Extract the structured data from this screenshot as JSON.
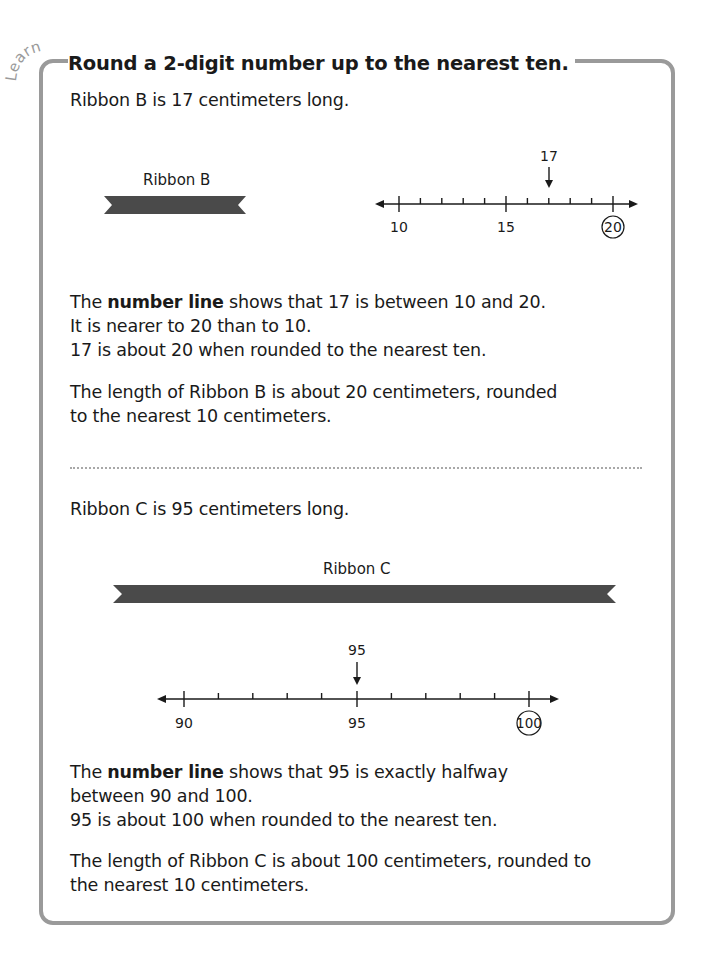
{
  "section_tag": "Learn",
  "title": "Round a 2-digit number up to the nearest ten.",
  "part_b": {
    "intro": "Ribbon B is 17 centimeters long.",
    "ribbon_label": "Ribbon B",
    "number_line": {
      "marked_value": "17",
      "labels": [
        "10",
        "15",
        "20"
      ],
      "circled_label": "20"
    },
    "explanation": {
      "line1_prefix": "The ",
      "line1_bold": "number line",
      "line1_suffix": " shows that 17 is between 10 and 20.",
      "line2": "It is nearer to 20 than to 10.",
      "line3": "17 is about 20 when rounded to the nearest ten."
    },
    "conclusion": {
      "line1": "The length of Ribbon B is about 20 centimeters, rounded",
      "line2": "to the nearest 10 centimeters."
    }
  },
  "part_c": {
    "intro": "Ribbon C is 95 centimeters long.",
    "ribbon_label": "Ribbon C",
    "number_line": {
      "marked_value": "95",
      "labels": [
        "90",
        "95",
        "100"
      ],
      "circled_label": "100"
    },
    "explanation": {
      "line1_prefix": "The ",
      "line1_bold": "number line",
      "line1_suffix": " shows that 95 is exactly halfway",
      "line2": "between 90 and 100.",
      "line3": "95 is about 100 when rounded to the nearest ten."
    },
    "conclusion": {
      "line1": "The length of Ribbon C is about 100 centimeters, rounded to",
      "line2": "the nearest 10 centimeters."
    }
  },
  "colors": {
    "frame": "#9a9a9a",
    "ribbon": "#4a4a4a",
    "text": "#1a1a1a"
  }
}
